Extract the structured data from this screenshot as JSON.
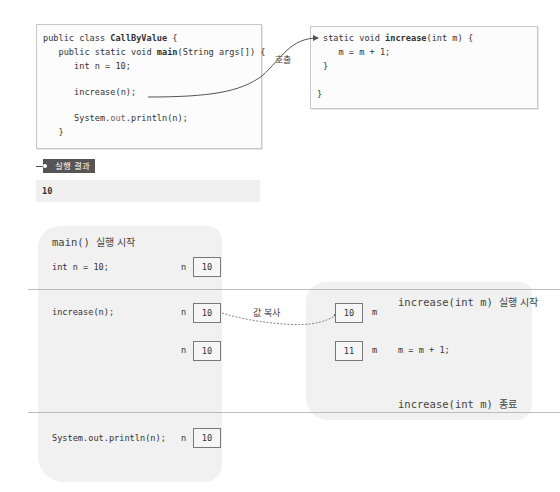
{
  "code": {
    "main_box": {
      "lines": [
        {
          "prefix": "public class ",
          "bold": "CallByValue",
          "suffix": " {"
        },
        {
          "prefix": "   public static void ",
          "bold": "main",
          "suffix": "(String args[]) {"
        },
        {
          "prefix": "      int n = 10;",
          "bold": "",
          "suffix": ""
        },
        {
          "prefix": "",
          "bold": "",
          "suffix": ""
        },
        {
          "prefix": "      ",
          "bold": "increase",
          "suffix": "(n);"
        },
        {
          "prefix": "",
          "bold": "",
          "suffix": ""
        },
        {
          "prefix": "      System.",
          "bold": "",
          "suffix": "out",
          "tail": ".println(n);"
        },
        {
          "prefix": "   }",
          "bold": "",
          "suffix": ""
        }
      ]
    },
    "increase_box": {
      "lines": [
        {
          "prefix": "static void ",
          "bold": "increase",
          "suffix": "(int m) {"
        },
        {
          "prefix": "   m = m + 1;",
          "bold": "",
          "suffix": ""
        },
        {
          "prefix": "}",
          "bold": "",
          "suffix": ""
        },
        {
          "prefix": "",
          "bold": "",
          "suffix": ""
        },
        {
          "prefix": "}",
          "bold": "",
          "suffix": ""
        }
      ]
    },
    "call_label": "호출"
  },
  "result": {
    "tag_label": "실행 결과",
    "output": "10"
  },
  "diagram": {
    "main_heading_code": "main()",
    "main_heading_text": "실행 시작",
    "rows": [
      {
        "statement": "int n = 10;",
        "var": "n",
        "value": "10"
      },
      {
        "statement": "increase(n);",
        "var": "n",
        "value": "10"
      },
      {
        "statement": "",
        "var": "n",
        "value": "10"
      },
      {
        "statement": "System.out.println(n);",
        "var": "n",
        "value": "10"
      }
    ],
    "copy_label": "값 복사",
    "increase_start_code": "increase(int m)",
    "increase_start_text": "실행 시작",
    "increase_rows": [
      {
        "value": "10",
        "var": "m",
        "statement": ""
      },
      {
        "value": "11",
        "var": "m",
        "statement": "m = m + 1;"
      }
    ],
    "increase_end_code": "increase(int m)",
    "increase_end_text": "종료"
  }
}
